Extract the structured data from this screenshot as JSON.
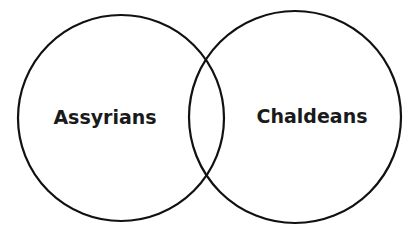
{
  "diagram": {
    "type": "venn",
    "background": "#ffffff",
    "stroke_color": "#111111",
    "stroke_width": 2.2,
    "text_color": "#1a1a1a",
    "sets": [
      {
        "id": "left",
        "label": "Assyrians",
        "cx": 121,
        "cy": 118,
        "r": 103,
        "label_x": 105,
        "label_y": 124
      },
      {
        "id": "right",
        "label": "Chaldeans",
        "cx": 295,
        "cy": 117,
        "r": 106,
        "label_x": 312,
        "label_y": 123
      }
    ],
    "intersection_label": ""
  }
}
